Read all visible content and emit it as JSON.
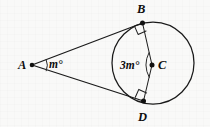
{
  "figure": {
    "background_color": "#f8f8f7",
    "ink_color": "#1a1a1a",
    "points": {
      "A": {
        "label": "A",
        "x": 32,
        "y": 65,
        "label_x": 18,
        "label_y": 69
      },
      "B": {
        "label": "B",
        "x": 142,
        "y": 23,
        "label_x": 137,
        "label_y": 13
      },
      "C": {
        "label": "C",
        "x": 152,
        "y": 65,
        "label_x": 158,
        "label_y": 69
      },
      "D": {
        "label": "D",
        "x": 143,
        "y": 101,
        "label_x": 138,
        "label_y": 121
      }
    },
    "circle": {
      "center_x": 153,
      "center_y": 63,
      "radius": 41
    },
    "angles": {
      "at_A": {
        "label": "m°",
        "label_x": 48,
        "label_y": 68
      },
      "at_C": {
        "label": "3m°",
        "label_x": 121,
        "label_y": 69
      }
    },
    "right_angle_marks": [
      {
        "at": "B",
        "label": "right-angle-mark-b"
      },
      {
        "at": "D",
        "label": "right-angle-mark-d"
      }
    ],
    "segments": [
      {
        "name": "tangent-AB",
        "from": "A",
        "to": "B"
      },
      {
        "name": "tangent-AD",
        "from": "A",
        "to": "D"
      },
      {
        "name": "radius-CB",
        "from": "C",
        "to": "B"
      },
      {
        "name": "radius-CD",
        "from": "C",
        "to": "D"
      }
    ]
  }
}
